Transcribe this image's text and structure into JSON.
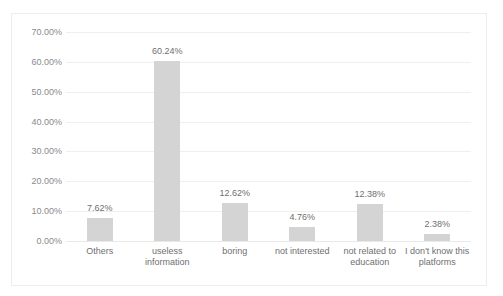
{
  "title_strip": {
    "text": " "
  },
  "chart_data": {
    "type": "bar",
    "title": "",
    "xlabel": "",
    "ylabel": "",
    "ylim": [
      0,
      70
    ],
    "ytick_step": 10,
    "ytick_labels": [
      "70.00%",
      "60.00%",
      "50.00%",
      "40.00%",
      "30.00%",
      "20.00%",
      "10.00%",
      "0.00%"
    ],
    "ytick_values": [
      70,
      60,
      50,
      40,
      30,
      20,
      10,
      0
    ],
    "grid": true,
    "legend": "none",
    "bar_color": "#d4d4d4",
    "gridline_color": "#efefef",
    "categories": [
      "Others",
      "useless information",
      "boring",
      "not interested",
      "not related to education",
      "I don't know this platforms"
    ],
    "values": [
      7.62,
      60.24,
      12.62,
      4.76,
      12.38,
      2.38
    ],
    "data_labels": [
      "7.62%",
      "60.24%",
      "12.62%",
      "4.76%",
      "12.38%",
      "2.38%"
    ]
  }
}
